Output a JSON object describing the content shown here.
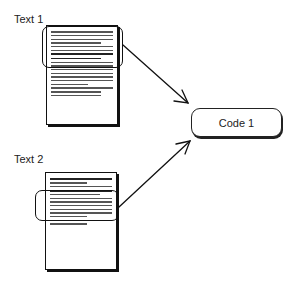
{
  "diagram": {
    "type": "qualitative-coding-illustration",
    "texts": [
      {
        "label": "Text 1",
        "highlighted_segment": "top",
        "body": "unreadable small printed text (approx. 18 lines)"
      },
      {
        "label": "Text 2",
        "highlighted_segment": "middle",
        "body": "unreadable small printed text (approx. 13 lines)"
      }
    ],
    "code": {
      "label": "Code 1"
    },
    "edges": [
      {
        "from": "Text 1 highlighted segment",
        "to": "Code 1"
      },
      {
        "from": "Text 2 highlighted segment",
        "to": "Code 1"
      }
    ],
    "colors": {
      "stroke": "#111111",
      "background": "#ffffff"
    }
  }
}
